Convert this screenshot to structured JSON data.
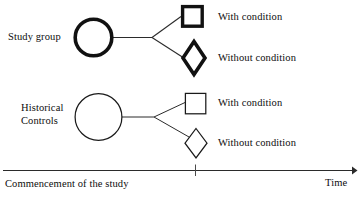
{
  "figure": {
    "type": "study-design-flow-diagram",
    "background_color": "#ffffff",
    "stroke_color": "#1a1a1a"
  },
  "groups": [
    {
      "id": "study-group",
      "label": "Study group",
      "emphasis": "bold",
      "node_shape": "circle",
      "outcomes": [
        {
          "id": "study-with-condition",
          "label": "With condition",
          "shape": "square",
          "emphasis": "bold"
        },
        {
          "id": "study-without-condition",
          "label": "Without condition",
          "shape": "diamond",
          "emphasis": "bold"
        }
      ]
    },
    {
      "id": "historical-controls",
      "label": "Historical\nControls",
      "emphasis": "thin",
      "node_shape": "circle",
      "outcomes": [
        {
          "id": "control-with-condition",
          "label": "With condition",
          "shape": "square",
          "emphasis": "thin"
        },
        {
          "id": "control-without-condition",
          "label": "Without condition",
          "shape": "diamond",
          "emphasis": "thin"
        }
      ]
    }
  ],
  "axis": {
    "start_label": "Commencement of the study",
    "end_label": "Time",
    "tick_position_label": "",
    "orientation": "horizontal",
    "arrow": "right"
  }
}
